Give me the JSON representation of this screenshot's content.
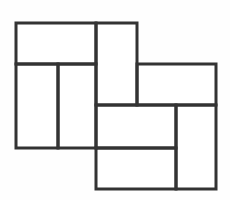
{
  "figure": {
    "name": "rectangle-tiling",
    "canvas": {
      "width": 230,
      "height": 200
    },
    "style": {
      "background_color": "#fefefe",
      "tile_fill_color": "#ffffff",
      "stroke_color": "#333333",
      "stroke_width": 3
    },
    "tiles": [
      {
        "id": "tile-top-left",
        "label": "top-left rectangle",
        "x": 16,
        "y": 23,
        "width": 80,
        "height": 41,
        "orientation": "horizontal"
      },
      {
        "id": "tile-upper-center-tall",
        "label": "upper center tall rectangle",
        "x": 96,
        "y": 23,
        "width": 41,
        "height": 82,
        "orientation": "vertical"
      },
      {
        "id": "tile-right-upper",
        "label": "upper right rectangle",
        "x": 137,
        "y": 64,
        "width": 79,
        "height": 41,
        "orientation": "horizontal"
      },
      {
        "id": "tile-left-inner",
        "label": "left inner tall rectangle",
        "x": 16,
        "y": 64,
        "width": 42,
        "height": 84,
        "orientation": "vertical"
      },
      {
        "id": "tile-left-outer",
        "label": "left outer tall rectangle",
        "x": 58,
        "y": 64,
        "width": 38,
        "height": 84,
        "orientation": "vertical"
      },
      {
        "id": "tile-center-lower",
        "label": "center lower rectangle",
        "x": 96,
        "y": 105,
        "width": 80,
        "height": 43,
        "orientation": "horizontal"
      },
      {
        "id": "tile-bottom-center",
        "label": "bottom center rectangle",
        "x": 96,
        "y": 148,
        "width": 80,
        "height": 41,
        "orientation": "horizontal"
      },
      {
        "id": "tile-right-lower-tall",
        "label": "lower right tall rectangle",
        "x": 176,
        "y": 105,
        "width": 40,
        "height": 84,
        "orientation": "vertical"
      }
    ]
  }
}
